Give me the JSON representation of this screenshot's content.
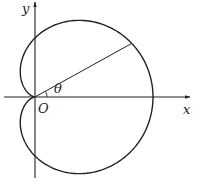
{
  "figure": {
    "type": "polar-curve-diagram",
    "curve": "cardioid",
    "labels": {
      "x_axis": "x",
      "y_axis": "y",
      "origin": "O",
      "angle": "θ"
    },
    "colors": {
      "stroke": "#222222",
      "background": "#ffffff"
    },
    "geometry": {
      "origin_px": [
        35,
        97
      ],
      "cardioid_a_px": 59,
      "radial_line_angle_deg": 29
    }
  }
}
